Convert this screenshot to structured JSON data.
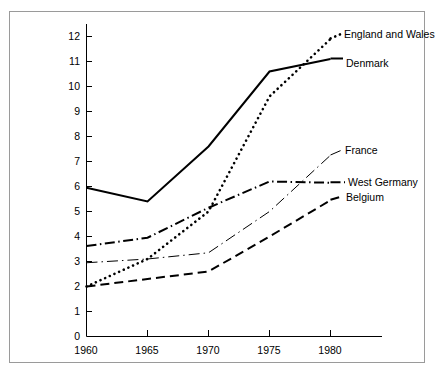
{
  "chart_data": {
    "type": "line",
    "title": "",
    "subtitle": "",
    "xlabel": "",
    "ylabel": "",
    "x": [
      1960,
      1965,
      1970,
      1975,
      1980
    ],
    "xticklabels": [
      "1960",
      "1965",
      "1970",
      "1975",
      "1980"
    ],
    "yticklabels": [
      "0",
      "1",
      "2",
      "3",
      "4",
      "5",
      "6",
      "7",
      "8",
      "9",
      "10",
      "11",
      "12"
    ],
    "xlim": [
      1960,
      1982
    ],
    "ylim": [
      0,
      12.4
    ],
    "grid": false,
    "legend_position": "right-of-line-end",
    "series": [
      {
        "name": "England and Wales",
        "style": "dotted",
        "color": "#000000",
        "values": [
          2.0,
          3.1,
          5.0,
          9.6,
          11.9
        ]
      },
      {
        "name": "Denmark",
        "style": "solid",
        "color": "#000000",
        "values": [
          5.95,
          5.4,
          7.6,
          10.6,
          11.1
        ]
      },
      {
        "name": "France",
        "style": "thin-dash-dot",
        "color": "#000000",
        "values": [
          2.95,
          3.1,
          3.35,
          5.0,
          7.25
        ]
      },
      {
        "name": "West Germany",
        "style": "dash-dot",
        "color": "#000000",
        "values": [
          3.62,
          3.95,
          5.15,
          6.2,
          6.15
        ]
      },
      {
        "name": "Belgium",
        "style": "dashed",
        "color": "#000000",
        "values": [
          2.0,
          2.3,
          2.6,
          4.0,
          5.45
        ]
      }
    ]
  },
  "axis": {
    "y_ticks": [
      "12",
      "11",
      "10",
      "9",
      "8",
      "7",
      "6",
      "5",
      "4",
      "3",
      "2",
      "1",
      "0"
    ],
    "x_ticks": [
      "1960",
      "1965",
      "1970",
      "1975",
      "1980"
    ]
  },
  "labels": {
    "england_and_wales": "England and Wales",
    "denmark": "Denmark",
    "france": "France",
    "west_germany": "West Germany",
    "belgium": "Belgium"
  },
  "colors": {
    "line": "#000000",
    "axis": "#000000",
    "frame": "#9a9a9a",
    "background": "#ffffff"
  }
}
